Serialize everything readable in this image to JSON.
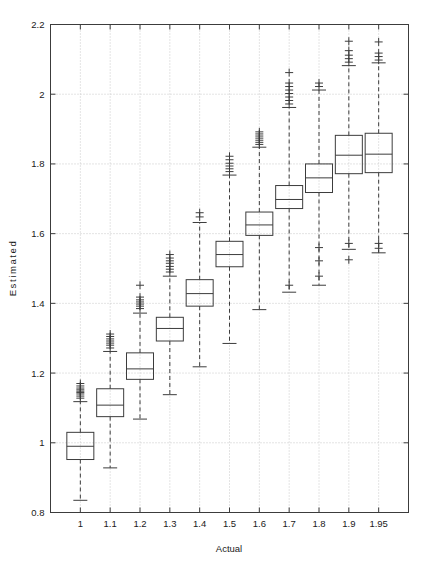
{
  "chart_data": {
    "type": "box",
    "title": "",
    "xlabel": "Actual",
    "ylabel": "Estimated",
    "xlim": [
      0.5,
      11.5
    ],
    "ylim": [
      0.8,
      2.2
    ],
    "yticks": [
      0.8,
      1,
      1.2,
      1.4,
      1.6,
      1.8,
      2,
      2.2
    ],
    "ytick_labels": [
      "0.8",
      "1",
      "1.2",
      "1.4",
      "1.6",
      "1.8",
      "2",
      "2.2"
    ],
    "categories": [
      "1",
      "1.1",
      "1.2",
      "1.3",
      "1.4",
      "1.5",
      "1.6",
      "1.7",
      "1.8",
      "1.9",
      "1.95"
    ],
    "grid": true,
    "grid_style": "dotted",
    "grid_color": "#c8c8c8",
    "line_color": "#3c3c3c",
    "box_fill": "none",
    "whisker_style": "dashed",
    "outlier_marker": "+",
    "legend": "none",
    "boxes": [
      {
        "category": "1",
        "whisker_low": 0.835,
        "q1": 0.952,
        "median": 0.99,
        "q3": 1.03,
        "whisker_high": 1.118,
        "outliers": [
          1.128,
          1.134,
          1.14,
          1.144,
          1.148,
          1.152,
          1.157,
          1.163,
          1.17
        ]
      },
      {
        "category": "1.1",
        "whisker_low": 0.928,
        "q1": 1.075,
        "median": 1.108,
        "q3": 1.155,
        "whisker_high": 1.262,
        "outliers": [
          1.272,
          1.28,
          1.286,
          1.292,
          1.298,
          1.305,
          1.312
        ]
      },
      {
        "category": "1.2",
        "whisker_low": 1.068,
        "q1": 1.182,
        "median": 1.212,
        "q3": 1.258,
        "whisker_high": 1.372,
        "outliers": [
          1.385,
          1.392,
          1.398,
          1.404,
          1.41,
          1.418,
          1.452
        ]
      },
      {
        "category": "1.3",
        "whisker_low": 1.138,
        "q1": 1.292,
        "median": 1.328,
        "q3": 1.36,
        "whisker_high": 1.478,
        "outliers": [
          1.49,
          1.498,
          1.506,
          1.515,
          1.522,
          1.53,
          1.54
        ]
      },
      {
        "category": "1.4",
        "whisker_low": 1.218,
        "q1": 1.392,
        "median": 1.428,
        "q3": 1.468,
        "whisker_high": 1.632,
        "outliers": [
          1.648,
          1.66
        ]
      },
      {
        "category": "1.5",
        "whisker_low": 1.285,
        "q1": 1.505,
        "median": 1.54,
        "q3": 1.578,
        "whisker_high": 1.768,
        "outliers": [
          1.778,
          1.786,
          1.794,
          1.802,
          1.812,
          1.822
        ]
      },
      {
        "category": "1.6",
        "whisker_low": 1.382,
        "q1": 1.595,
        "median": 1.625,
        "q3": 1.662,
        "whisker_high": 1.848,
        "outliers": [
          1.856,
          1.862,
          1.868,
          1.874,
          1.88,
          1.886,
          1.892
        ]
      },
      {
        "category": "1.7",
        "whisker_low": 1.432,
        "q1": 1.672,
        "median": 1.698,
        "q3": 1.738,
        "whisker_high": 1.962,
        "outliers": [
          1.452,
          1.972,
          1.982,
          1.992,
          2.002,
          2.012,
          2.022,
          2.032,
          2.062
        ]
      },
      {
        "category": "1.8",
        "whisker_low": 1.452,
        "q1": 1.718,
        "median": 1.76,
        "q3": 1.8,
        "whisker_high": 2.012,
        "outliers": [
          1.478,
          1.522,
          1.56,
          2.022,
          2.032
        ]
      },
      {
        "category": "1.9",
        "whisker_low": 1.555,
        "q1": 1.772,
        "median": 1.825,
        "q3": 1.882,
        "whisker_high": 2.082,
        "outliers": [
          1.525,
          1.572,
          2.092,
          2.102,
          2.112,
          2.125,
          2.152
        ]
      },
      {
        "category": "1.95",
        "whisker_low": 1.545,
        "q1": 1.775,
        "median": 1.828,
        "q3": 1.888,
        "whisker_high": 2.09,
        "outliers": [
          1.558,
          1.572,
          2.098,
          2.108,
          2.118,
          2.15
        ]
      }
    ]
  }
}
